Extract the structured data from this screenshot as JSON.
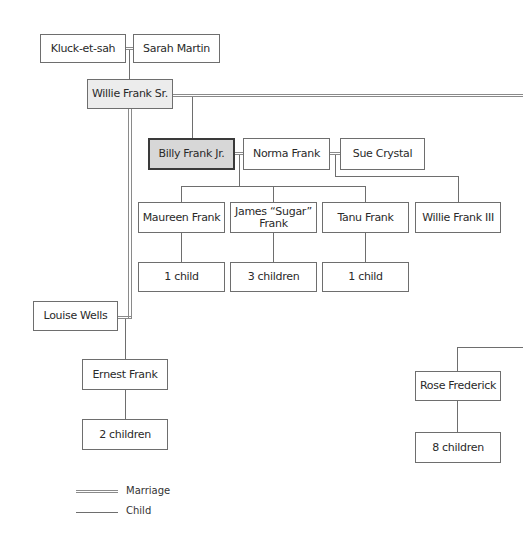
{
  "diagram": {
    "type": "family-tree",
    "generation1": {
      "left": "Kluck-et-sah",
      "right": "Sarah Martin"
    },
    "generation2": {
      "patriarch": "Willie Frank Sr.",
      "spouse_lower": "Louise Wells"
    },
    "generation3": {
      "focus": "Billy Frank Jr.",
      "spouse1": "Norma Frank",
      "spouse2": "Sue Crystal",
      "half_sibling": "Ernest Frank",
      "other_branch": "Rose Frederick"
    },
    "generation4": {
      "children": [
        "Maureen Frank",
        "James “Sugar” Frank",
        "Tanu Frank",
        "Willie Frank III"
      ],
      "james_line1": "James “Sugar”",
      "james_line2": "Frank"
    },
    "descendants": {
      "maureen": "1 child",
      "james": "3 children",
      "tanu": "1 child",
      "ernest": "2 children",
      "rose": "8 children"
    },
    "legend": {
      "marriage": "Marriage",
      "child": "Child"
    },
    "colors": {
      "line": "#6e6e6e",
      "focus_fill": "#d7d7d7",
      "patriarch_fill": "#ececec"
    }
  }
}
